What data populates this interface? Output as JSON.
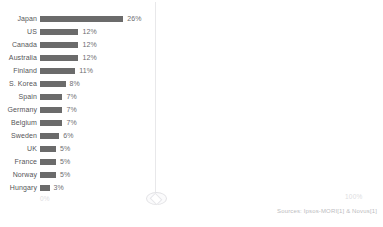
{
  "chart_data": {
    "type": "bar",
    "orientation": "horizontal",
    "title": "",
    "xlabel": "",
    "ylabel": "",
    "categories": [
      "Japan",
      "US",
      "Canada",
      "Australia",
      "Finland",
      "S. Korea",
      "Spain",
      "Germany",
      "Belgium",
      "Sweden",
      "UK",
      "France",
      "Norway",
      "Hungary"
    ],
    "values": [
      26,
      12,
      12,
      12,
      11,
      8,
      7,
      7,
      7,
      6,
      5,
      5,
      5,
      3
    ],
    "value_labels": [
      "26%",
      "12%",
      "12%",
      "12%",
      "11%",
      "8%",
      "7%",
      "7%",
      "7%",
      "6%",
      "5%",
      "5%",
      "5%",
      "3%"
    ],
    "xlim": [
      0,
      100
    ],
    "grid": false,
    "legend": false,
    "bar_color": "#6b6b6b"
  },
  "axis": {
    "min_label": "0%",
    "max_label": "100%"
  },
  "footer": {
    "source": "Sources: Ipsos-MORI[1] & Novus[1]"
  },
  "colors": {
    "bar": "#6b6b6b",
    "label": "#555558",
    "value": "#6d6d70",
    "axis": "#dcdce0",
    "source": "#bcbcc0",
    "guide": "#e8e8ea",
    "background": "#ffffff"
  }
}
